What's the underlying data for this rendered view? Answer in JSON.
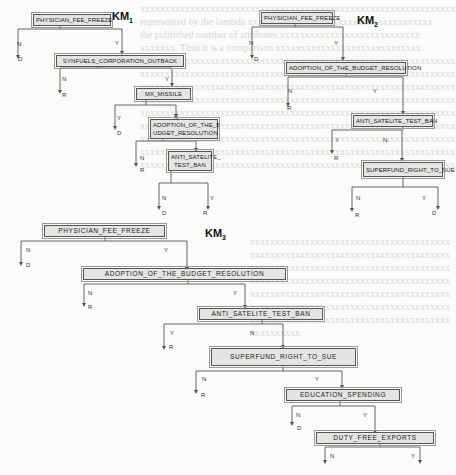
{
  "diagrams": [
    {
      "title": "KM",
      "title_sub": "1",
      "nodes": [
        {
          "id": "k1n1",
          "label": "PHYSICIAN_FEE_FREEZE"
        },
        {
          "id": "k1n2",
          "label": "SYNFUELS_CORPORATION_OUTBACK"
        },
        {
          "id": "k1n3",
          "label": "MX_MISSILE"
        },
        {
          "id": "k1n4",
          "label": "ADOPTION_OF_THE_B UDGET_RESOLUTION"
        },
        {
          "id": "k1n5",
          "label": "ANTI_SATELITE_ TEST_BAN"
        }
      ],
      "edges": [
        {
          "from": "PHYSICIAN_FEE_FREEZE",
          "label": "N",
          "to": "D"
        },
        {
          "from": "PHYSICIAN_FEE_FREEZE",
          "label": "Y",
          "to": "SYNFUELS_CORPORATION_OUTBACK"
        },
        {
          "from": "SYNFUELS_CORPORATION_OUTBACK",
          "label": "N",
          "to": "R"
        },
        {
          "from": "SYNFUELS_CORPORATION_OUTBACK",
          "label": "Y",
          "to": "MX_MISSILE"
        },
        {
          "from": "MX_MISSILE",
          "label": "Y",
          "to": "D"
        },
        {
          "from": "MX_MISSILE",
          "label": "N",
          "to": "ADOPTION_OF_THE_BUDGET_RESOLUTION"
        },
        {
          "from": "ADOPTION_OF_THE_BUDGET_RESOLUTION",
          "label": "N",
          "to": "R"
        },
        {
          "from": "ADOPTION_OF_THE_BUDGET_RESOLUTION",
          "label": "Y",
          "to": "ANTI_SATELITE_TEST_BAN"
        },
        {
          "from": "ANTI_SATELITE_TEST_BAN",
          "label": "N",
          "to": "D"
        },
        {
          "from": "ANTI_SATELITE_TEST_BAN",
          "label": "Y",
          "to": "R"
        }
      ]
    },
    {
      "title": "KM",
      "title_sub": "2",
      "nodes": [
        {
          "id": "k2n1",
          "label": "PHYSICIAN_FEE_FREEZE"
        },
        {
          "id": "k2n2",
          "label": "ADOPTION_OF_THE_BUDGET_RESOLUTION"
        },
        {
          "id": "k2n3",
          "label": "ANTI_SATELITE_TEST_BAN"
        },
        {
          "id": "k2n4",
          "label": "SUPERFUND_RIGHT_TO_SUE"
        }
      ],
      "edges": [
        {
          "from": "PHYSICIAN_FEE_FREEZE",
          "label": "N",
          "to": "D"
        },
        {
          "from": "PHYSICIAN_FEE_FREEZE",
          "label": "Y",
          "to": "ADOPTION_OF_THE_BUDGET_RESOLUTION"
        },
        {
          "from": "ADOPTION_OF_THE_BUDGET_RESOLUTION",
          "label": "N",
          "to": "R"
        },
        {
          "from": "ADOPTION_OF_THE_BUDGET_RESOLUTION",
          "label": "Y",
          "to": "ANTI_SATELITE_TEST_BAN"
        },
        {
          "from": "ANTI_SATELITE_TEST_BAN",
          "label": "Y",
          "to": "R"
        },
        {
          "from": "ANTI_SATELITE_TEST_BAN",
          "label": "N",
          "to": "SUPERFUND_RIGHT_TO_SUE"
        },
        {
          "from": "SUPERFUND_RIGHT_TO_SUE",
          "label": "N",
          "to": "R"
        },
        {
          "from": "SUPERFUND_RIGHT_TO_SUE",
          "label": "Y",
          "to": "D"
        }
      ]
    },
    {
      "title": "KM",
      "title_sub": "3",
      "nodes": [
        {
          "id": "k3n1",
          "label": "PHYSICIAN_FEE_FREEZE"
        },
        {
          "id": "k3n2",
          "label": "ADOPTION_OF_THE_BUDGET_RESOLUTION"
        },
        {
          "id": "k3n3",
          "label": "ANTI_SATELITE_TEST_BAN"
        },
        {
          "id": "k3n4",
          "label": "SUPERFUND_RIGHT_TO_SUE"
        },
        {
          "id": "k3n5",
          "label": "EDUCATION_SPENDING"
        },
        {
          "id": "k3n6",
          "label": "DUTY_FREE_EXPORTS"
        }
      ],
      "edges": [
        {
          "from": "PHYSICIAN_FEE_FREEZE",
          "label": "N",
          "to": "D"
        },
        {
          "from": "PHYSICIAN_FEE_FREEZE",
          "label": "Y",
          "to": "ADOPTION_OF_THE_BUDGET_RESOLUTION"
        },
        {
          "from": "ADOPTION_OF_THE_BUDGET_RESOLUTION",
          "label": "N",
          "to": "R"
        },
        {
          "from": "ADOPTION_OF_THE_BUDGET_RESOLUTION",
          "label": "Y",
          "to": "ANTI_SATELITE_TEST_BAN"
        },
        {
          "from": "ANTI_SATELITE_TEST_BAN",
          "label": "Y",
          "to": "R"
        },
        {
          "from": "ANTI_SATELITE_TEST_BAN",
          "label": "N",
          "to": "SUPERFUND_RIGHT_TO_SUE"
        },
        {
          "from": "SUPERFUND_RIGHT_TO_SUE",
          "label": "N",
          "to": "R"
        },
        {
          "from": "SUPERFUND_RIGHT_TO_SUE",
          "label": "Y",
          "to": "EDUCATION_SPENDING"
        },
        {
          "from": "EDUCATION_SPENDING",
          "label": "N",
          "to": "D"
        },
        {
          "from": "EDUCATION_SPENDING",
          "label": "Y",
          "to": "DUTY_FREE_EXPORTS"
        },
        {
          "from": "DUTY_FREE_EXPORTS",
          "label": "N",
          "to": ""
        },
        {
          "from": "DUTY_FREE_EXPORTS",
          "label": "Y",
          "to": ""
        }
      ]
    }
  ],
  "labels": {
    "N": "N",
    "Y": "Y",
    "D": "D",
    "R": "R"
  }
}
